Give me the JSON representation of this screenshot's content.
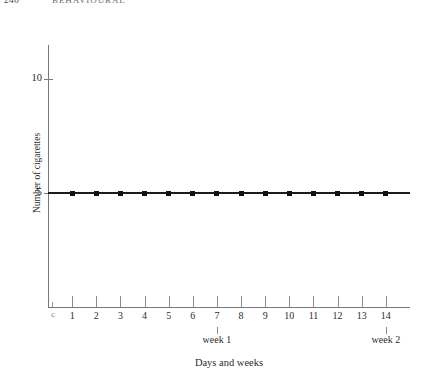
{
  "running_head": {
    "page_number": "246",
    "title": "BEHAVIOURAL"
  },
  "chart_data": {
    "type": "line",
    "title": "",
    "xlabel": "Days and weeks",
    "ylabel": "Number of cigarettes",
    "x": [
      1,
      2,
      3,
      4,
      5,
      6,
      7,
      8,
      9,
      10,
      11,
      12,
      13,
      14
    ],
    "values": [
      5,
      5,
      5,
      5,
      5,
      5,
      5,
      5,
      5,
      5,
      5,
      5,
      5,
      5
    ],
    "series": [
      {
        "name": "Cigarettes per day",
        "values": [
          5,
          5,
          5,
          5,
          5,
          5,
          5,
          5,
          5,
          5,
          5,
          5,
          5,
          5
        ]
      }
    ],
    "categories": [
      "1",
      "2",
      "3",
      "4",
      "5",
      "6",
      "7",
      "8",
      "9",
      "10",
      "11",
      "12",
      "13",
      "14"
    ],
    "xtick_labels": [
      "1",
      "2",
      "3",
      "4",
      "5",
      "6",
      "7",
      "8",
      "9",
      "10",
      "11",
      "12",
      "13",
      "14"
    ],
    "origin_tick_label": "c",
    "ytick_values": [
      5,
      10
    ],
    "ytick_labels": [
      "5",
      "10"
    ],
    "ylim": [
      0,
      11.5
    ],
    "xlim": [
      0,
      15
    ],
    "grid": false,
    "legend": false,
    "annotations": [
      {
        "label": "week 1",
        "x": 7
      },
      {
        "label": "week 2",
        "x": 14
      }
    ],
    "line_color": "#1c1c1c",
    "marker_color": "#111111",
    "axis_color": "#77777e"
  }
}
